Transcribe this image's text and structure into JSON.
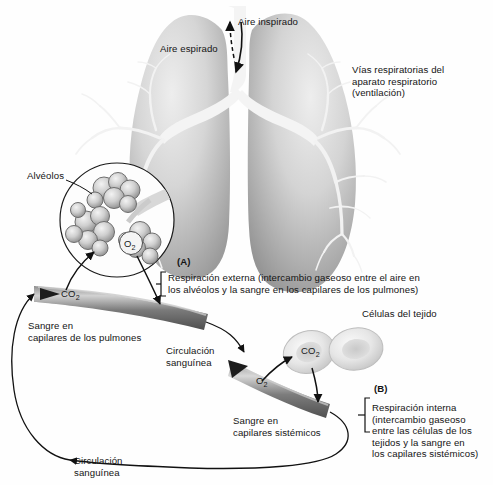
{
  "figure": {
    "background_color": "#fefefe",
    "text_color": "#141414"
  },
  "labels": {
    "aire_inspirado": "Aire inspirado",
    "aire_espirado": "Aire espirado",
    "vias_respiratorias": "Vías respiratorias del\naparato respiratorio\n(ventilación)",
    "alveolos": "Alvéolos",
    "marker_a": "(A)",
    "respiracion_externa": "Respiración externa (intercambio gaseoso entre el aire en\nlos alvéolos y la sangre en los capilares de los pulmones)",
    "sangre_capilares_pulmones": "Sangre en\ncapilares de los pulmones",
    "celulas_del_tejido": "Células del tejido",
    "circulacion_sanguinea_1": "Circulación\nsanguínea",
    "marker_b": "(B)",
    "sangre_capilares_sistemicos": "Sangre en\ncapilares sistémicos",
    "respiracion_interna": "Respiración interna\n(intercambio gaseoso\nentre las células de los\ntejidos y la sangre en\nlos capilares sistémicos)",
    "circulacion_sanguinea_2": "Circulación\nsanguínea"
  },
  "gas_labels": {
    "o2_alveolar": "O",
    "o2_alveolar_sub": "2",
    "co2_pulmonary": "CO",
    "co2_pulmonary_sub": "2",
    "co2_tissue": "CO",
    "co2_tissue_sub": "2",
    "o2_systemic": "O",
    "o2_systemic_sub": "2"
  },
  "icon_names": {
    "lungs": "lungs-illustration",
    "alveoli": "alveoli-cluster-icon",
    "tissue_cells": "tissue-cell-icon",
    "pulmonary_capillary": "pulmonary-capillary-vessel",
    "systemic_capillary": "systemic-capillary-vessel",
    "inspired_arrow": "inspired-air-arrow",
    "expired_arrow": "expired-air-arrow"
  },
  "colors": {
    "lung_light": "#e3e3e3",
    "lung_mid": "#c2c2c2",
    "lung_dark": "#9a9a9a",
    "airway": "#f2f2f2",
    "vessel_dark": "#5a5a5a",
    "vessel_mid": "#8f8f8f",
    "vessel_light": "#cfcfcf",
    "cell_fill": "#e8e8e8",
    "cell_edge": "#b5b5b5",
    "stroke": "#1a1a1a"
  }
}
